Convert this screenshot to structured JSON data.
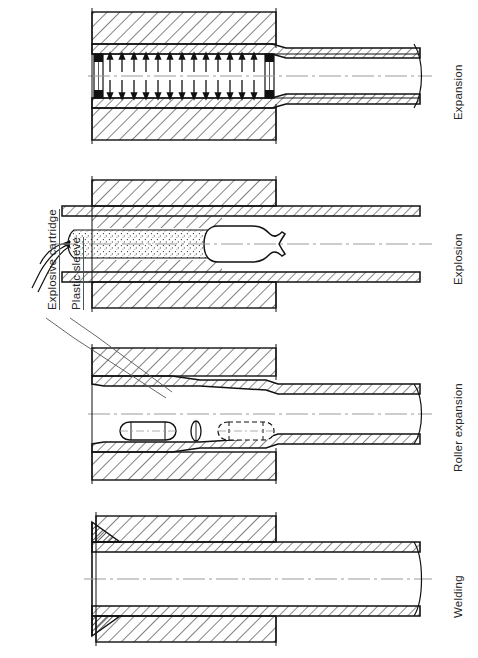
{
  "figure": {
    "background_color": "#ffffff",
    "line_color": "#111111",
    "hatch_color": "#1a1a1a",
    "centerline_color": "#8a8a8a",
    "width_px": 478,
    "height_px": 658
  },
  "callouts": [
    {
      "id": "explosive-cartridge",
      "label": "Explosive cartridge",
      "icon": "leader-line",
      "rot_deg": -90,
      "text_x": 40,
      "text_y": 300
    },
    {
      "id": "plastic-sleeve",
      "label": "Plastic sleeve",
      "icon": "leader-line",
      "rot_deg": -90,
      "text_x": 64,
      "text_y": 300
    }
  ],
  "panels": [
    {
      "id": "expansion",
      "label": "Expansion",
      "order": 1,
      "top_px": 4,
      "height_px": 150,
      "label_x": 452,
      "label_y": 118,
      "description": "Hydraulic expansion: radial pressure arrows press the tube wall outward against the tubesheet bore, sealed by end packers.",
      "features": [
        "tubesheet-hatched-block",
        "tube-wall-hatched",
        "radial-pressure-arrows",
        "end-seal-packers",
        "centerline",
        "break-line"
      ],
      "arrow_count_per_side": 13
    },
    {
      "id": "explosion",
      "label": "Explosion",
      "order": 2,
      "top_px": 172,
      "height_px": 145,
      "label_x": 452,
      "label_y": 282,
      "description": "Explosive expansion: an explosive cartridge inside a plastic sleeve is detonated to drive the tube into the tubesheet.",
      "features": [
        "tubesheet-hatched-block",
        "tube-wall-hatched",
        "explosive-charge-stipple",
        "plastic-sleeve-nozzle",
        "detonator-leads",
        "centerline"
      ]
    },
    {
      "id": "roller-expansion",
      "label": "Roller expansion",
      "order": 3,
      "top_px": 340,
      "height_px": 150,
      "label_x": 452,
      "label_y": 468,
      "description": "Roller expansion: a mandrel-driven roller travels along the bore, cold-working the tube outward into the tubesheet.",
      "features": [
        "tubesheet-hatched-block",
        "tube-wall-hatched",
        "roller-solid",
        "roller-dashed-alternate",
        "mandrel-ellipse",
        "centerline"
      ]
    },
    {
      "id": "welding",
      "label": "Welding",
      "order": 4,
      "top_px": 508,
      "height_px": 140,
      "label_x": 452,
      "label_y": 618,
      "description": "Strength welding: a fillet weld joins the tube end to the face of the tubesheet.",
      "features": [
        "tubesheet-hatched-block",
        "tube-wall-hatched",
        "fillet-weld-bead",
        "centerline",
        "break-line"
      ]
    }
  ]
}
